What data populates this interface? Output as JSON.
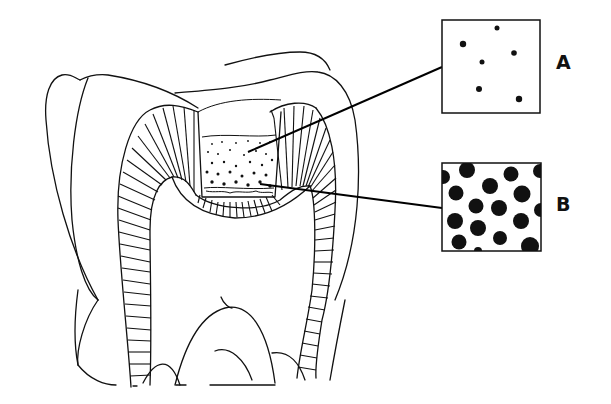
{
  "diagram": {
    "insets": [
      {
        "label": "A",
        "description": "sparse particles",
        "dot_count": 6
      },
      {
        "label": "B",
        "description": "dense particles",
        "dot_count": 17
      }
    ]
  },
  "colors": {
    "line": "#111111",
    "background": "#ffffff"
  }
}
